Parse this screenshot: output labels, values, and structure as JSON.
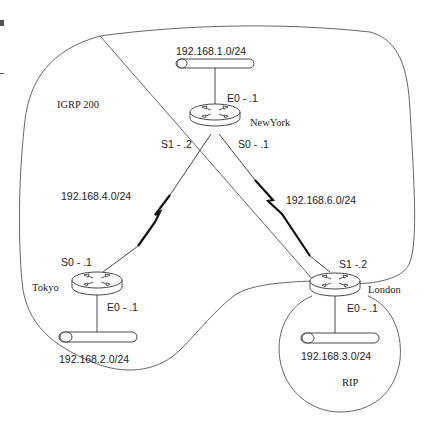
{
  "domain_labels": {
    "igrp_region": "IGRP 200",
    "rip_region": "RIP"
  },
  "routers": [
    {
      "name": "NewYork",
      "interfaces": {
        "e0": "E0 - .1",
        "s1": "S1 - .2",
        "s0": "S0 - .1"
      }
    },
    {
      "name": "Tokyo",
      "interfaces": {
        "s0": "S0 - .1",
        "e0": "E0 - .1"
      }
    },
    {
      "name": "London",
      "interfaces": {
        "s1": "S1 -.2",
        "e0": "E0 - .1"
      }
    }
  ],
  "networks": {
    "ny_lan": "192.168.1.0/24",
    "tokyo_lan": "192.168.2.0/24",
    "london_lan": "192.168.3.0/24",
    "ny_tokyo_wan": "192.168.4.0/24",
    "ny_london_wan": "192.168.6.0/24"
  },
  "colors": {
    "line": "#333333",
    "boundary": "#555555",
    "router_fill": "#ffffff"
  }
}
